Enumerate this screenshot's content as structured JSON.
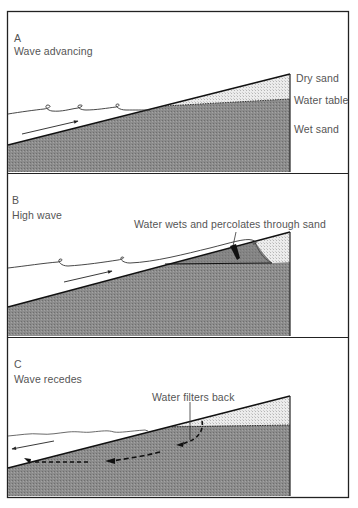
{
  "panels": [
    {
      "letter": "A",
      "title": "Wave advancing",
      "labels": {
        "dry_sand": "Dry sand",
        "water_table": "Water table",
        "wet_sand": "Wet sand"
      }
    },
    {
      "letter": "B",
      "title": "High wave",
      "labels": {
        "annotation": "Water wets and percolates through sand"
      }
    },
    {
      "letter": "C",
      "title": "Wave recedes",
      "labels": {
        "annotation": "Water filters back"
      }
    }
  ],
  "colors": {
    "wet_sand": "#8a8a8a",
    "dry_sand": "#e4e4e4",
    "outline": "#222222",
    "text": "#555555"
  }
}
